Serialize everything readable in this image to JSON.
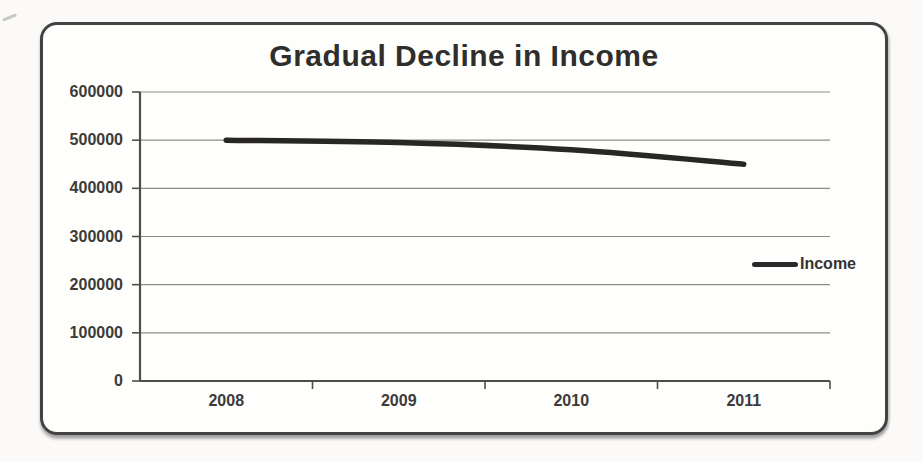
{
  "page": {
    "background": "#fbfaf8"
  },
  "card": {
    "border_color": "#444343",
    "background": "#fefefc"
  },
  "chart_data": {
    "type": "line",
    "title": "Gradual Decline in Income",
    "categories": [
      "2008",
      "2009",
      "2010",
      "2011"
    ],
    "series": [
      {
        "name": "Income",
        "values": [
          500000,
          495000,
          480000,
          450000
        ],
        "color": "#282726"
      }
    ],
    "xlabel": "",
    "ylabel": "",
    "ylim": [
      0,
      600000
    ],
    "yticks": [
      600000,
      500000,
      400000,
      300000,
      200000,
      100000,
      0
    ],
    "ytick_step": 100000,
    "grid": true,
    "legend_position": "right",
    "axis_color": "#4e4d4c",
    "grid_color": "#8d8c8a",
    "text_color": "#3c3b3a"
  },
  "legend": {
    "label": "Income"
  }
}
